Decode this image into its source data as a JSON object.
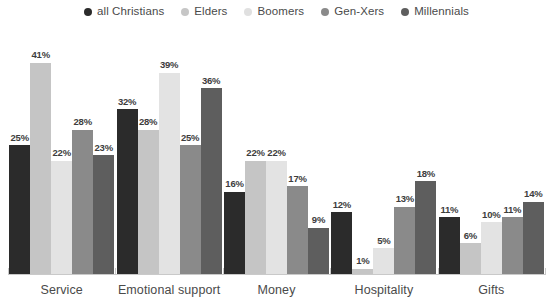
{
  "chart_data": {
    "type": "bar",
    "title": "",
    "subtitle": "",
    "xlabel": "",
    "ylabel": "",
    "ylim": [
      0,
      45
    ],
    "grid": false,
    "legend_position": "top-center",
    "categories": [
      "Service",
      "Emotional support",
      "Money",
      "Hospitality",
      "Gifts"
    ],
    "series": [
      {
        "name": "all Christians",
        "color": "#2b2b2b",
        "textured": false,
        "values": [
          25,
          32,
          16,
          12,
          11
        ],
        "labels": [
          "25%",
          "32%",
          "16%",
          "12%",
          "11%"
        ]
      },
      {
        "name": "Elders",
        "color": "#c5c5c5",
        "textured": false,
        "values": [
          41,
          28,
          22,
          1,
          6
        ],
        "labels": [
          "41%",
          "28%",
          "22%",
          "1%",
          "6%"
        ]
      },
      {
        "name": "Boomers",
        "color": "#e3e3e3",
        "textured": false,
        "values": [
          22,
          39,
          22,
          5,
          10
        ],
        "labels": [
          "22%",
          "39%",
          "22%",
          "5%",
          "10%"
        ]
      },
      {
        "name": "Gen-Xers",
        "color": "#8a8a8a",
        "textured": false,
        "values": [
          28,
          25,
          17,
          13,
          11
        ],
        "labels": [
          "28%",
          "25%",
          "17%",
          "13%",
          "11%"
        ]
      },
      {
        "name": "Millennials",
        "color": "#5e5e5e",
        "textured": true,
        "values": [
          23,
          36,
          9,
          18,
          14
        ],
        "labels": [
          "23%",
          "36%",
          "9%",
          "18%",
          "14%"
        ]
      }
    ]
  },
  "legend": {
    "items": [
      {
        "label": "all Christians",
        "color": "#2b2b2b"
      },
      {
        "label": "Elders",
        "color": "#c6c6c6"
      },
      {
        "label": "Boomers",
        "color": "#e0e0e0"
      },
      {
        "label": "Gen-Xers",
        "color": "#8a8a8a"
      },
      {
        "label": "Millennials",
        "color": "#5e5e5e"
      }
    ]
  },
  "axis": {
    "baseline_color": "#c9c9c9"
  }
}
